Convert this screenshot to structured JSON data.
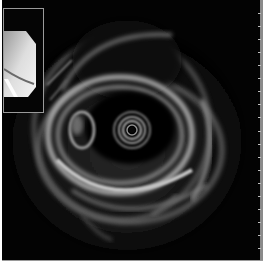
{
  "image": {
    "type": "endoscopic-ultrasound",
    "description": "Grayscale radial ultrasound image showing concentric ring transducer artifact in the center with surrounding echogenic wall layers",
    "background_color": "#030303",
    "border_color": "#9a9a9a"
  },
  "inset": {
    "description": "Endoscopic view thumbnail in top-left corner",
    "border_color": "#9a9a9a"
  },
  "scale": {
    "side": "right",
    "tick_count": 20
  },
  "colors": {
    "echo_bright": "#d8d8d8",
    "echo_mid": "#7a7a7a",
    "echo_dark": "#1a1a1a"
  }
}
